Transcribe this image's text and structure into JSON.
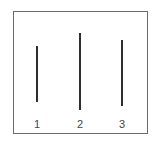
{
  "figure": {
    "lines": [
      {
        "label": "1",
        "x": 37,
        "top": 46,
        "bottom": 102
      },
      {
        "label": "2",
        "x": 80,
        "top": 33,
        "bottom": 110
      },
      {
        "label": "3",
        "x": 122,
        "top": 40,
        "bottom": 106
      }
    ],
    "line_color": "#2e2e2e",
    "frame_color": "#6a6a6a"
  }
}
